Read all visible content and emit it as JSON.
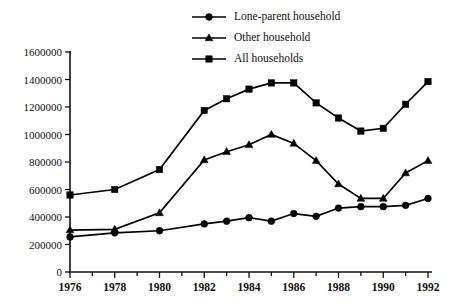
{
  "chart_data": {
    "type": "line",
    "title": "",
    "subtitle": "",
    "xlabel": "",
    "ylabel": "",
    "x": [
      1976,
      1977,
      1978,
      1979,
      1980,
      1981,
      1982,
      1983,
      1984,
      1985,
      1986,
      1987,
      1988,
      1989,
      1990,
      1991,
      1992
    ],
    "xlim": [
      1976,
      1992
    ],
    "ylim": [
      0,
      1600000
    ],
    "grid": false,
    "legend_position": "top-center",
    "x_tick_labels": [
      "1976",
      "1978",
      "1980",
      "1982",
      "1984",
      "1986",
      "1988",
      "1990",
      "1992"
    ],
    "x_tick_values": [
      1976,
      1978,
      1980,
      1982,
      1984,
      1986,
      1988,
      1990,
      1992
    ],
    "x_minor_tick_values": [
      1977,
      1979,
      1981,
      1983,
      1985,
      1987,
      1989,
      1991
    ],
    "y_tick_labels": [
      "0",
      "200000",
      "400000",
      "600000",
      "800000",
      "1000000",
      "1200000",
      "1400000",
      "1600000"
    ],
    "y_tick_values": [
      0,
      200000,
      400000,
      600000,
      800000,
      1000000,
      1200000,
      1400000,
      1600000
    ],
    "series": [
      {
        "name": "Lone-parent household",
        "marker": "circle",
        "color": "#000000",
        "x": [
          1976,
          1978,
          1980,
          1982,
          1983,
          1984,
          1985,
          1986,
          1987,
          1988,
          1989,
          1990,
          1991,
          1992
        ],
        "values": [
          255000,
          285000,
          300000,
          350000,
          370000,
          395000,
          370000,
          425000,
          405000,
          465000,
          475000,
          475000,
          485000,
          535000
        ]
      },
      {
        "name": "Other household",
        "marker": "triangle",
        "color": "#000000",
        "x": [
          1976,
          1978,
          1980,
          1982,
          1983,
          1984,
          1985,
          1986,
          1987,
          1988,
          1989,
          1990,
          1991,
          1992
        ],
        "values": [
          305000,
          310000,
          430000,
          815000,
          875000,
          925000,
          1000000,
          935000,
          810000,
          640000,
          535000,
          535000,
          720000,
          810000
        ]
      },
      {
        "name": "All households",
        "marker": "square",
        "color": "#000000",
        "x": [
          1976,
          1978,
          1980,
          1982,
          1983,
          1984,
          1985,
          1986,
          1987,
          1988,
          1989,
          1990,
          1991,
          1992
        ],
        "values": [
          560000,
          600000,
          745000,
          1175000,
          1260000,
          1330000,
          1375000,
          1375000,
          1230000,
          1120000,
          1025000,
          1045000,
          1220000,
          1385000
        ]
      }
    ]
  },
  "legend": {
    "items": [
      {
        "label": "Lone-parent household",
        "marker": "circle"
      },
      {
        "label": "Other household",
        "marker": "triangle"
      },
      {
        "label": "All households",
        "marker": "square"
      }
    ]
  }
}
